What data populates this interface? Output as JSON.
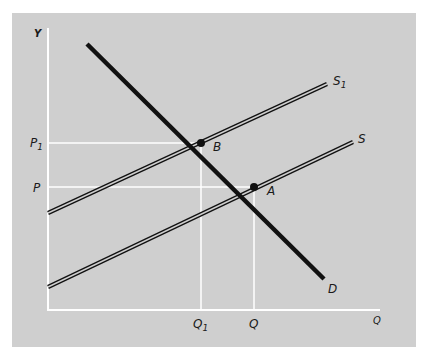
{
  "diagram": {
    "type": "supply-demand shift",
    "colors": {
      "background": "#cfcfcf",
      "axis": "#ffffff",
      "guides": "#ffffff",
      "curves": "#111111"
    },
    "axes": {
      "y_label": "Y",
      "x_label": "Q"
    },
    "y_ticks": [
      {
        "label": "P",
        "sub": "1"
      },
      {
        "label": "P",
        "sub": ""
      }
    ],
    "x_ticks": [
      {
        "label": "Q",
        "sub": "1"
      },
      {
        "label": "Q",
        "sub": ""
      }
    ],
    "curves": [
      {
        "name": "S1",
        "label": "S",
        "sub": "1",
        "style": "double"
      },
      {
        "name": "S",
        "label": "S",
        "sub": "",
        "style": "double"
      },
      {
        "name": "D",
        "label": "D",
        "sub": "",
        "style": "thick"
      }
    ],
    "points": [
      {
        "label": "B",
        "desc": "intersection of D and S1 at (Q1, P1)"
      },
      {
        "label": "A",
        "desc": "intersection of D and S at (Q, P)"
      }
    ]
  }
}
